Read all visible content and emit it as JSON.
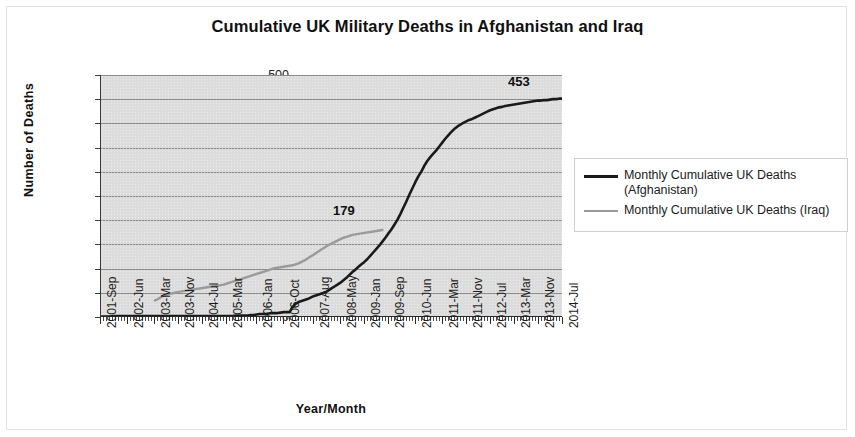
{
  "chart_data": {
    "type": "line",
    "title": "Cumulative UK Military Deaths in Afghanistan and Iraq",
    "xlabel": "Year/Month",
    "ylabel": "Number of  Deaths",
    "ylim": [
      0,
      500
    ],
    "ytick_step": 50,
    "yticks": [
      0,
      50,
      100,
      150,
      200,
      250,
      300,
      350,
      400,
      450,
      500
    ],
    "grid": "horizontal",
    "legend_position": "right",
    "plot_background": "#dcdcdc",
    "x_tick_labels": [
      "2001-Sep",
      "2002-Jun",
      "2003-Mar",
      "2003-Nov",
      "2004-Jul",
      "2005-Mar",
      "2006-Jan",
      "2006-Oct",
      "2007-Aug",
      "2008-May",
      "2009-Jan",
      "2009-Sep",
      "2010-Jun",
      "2011-Mar",
      "2011-Nov",
      "2012-Jul",
      "2013-Mar",
      "2013-Nov",
      "2014-Jul"
    ],
    "x_tick_indices": [
      0,
      9,
      18,
      26,
      34,
      42,
      52,
      61,
      71,
      80,
      88,
      96,
      105,
      114,
      122,
      130,
      138,
      146,
      154
    ],
    "x_count": 155,
    "x_start": "2001-Sep",
    "x_end": "2014-Jul",
    "series": [
      {
        "name": "Monthly Cumulative UK Deaths (Afghanistan)",
        "color": "#1a1a1a",
        "width": 2.6,
        "end_label": "453",
        "end_value": 453,
        "values": [
          0,
          0,
          0,
          0,
          1,
          1,
          1,
          1,
          1,
          1,
          1,
          1,
          1,
          1,
          1,
          1,
          1,
          1,
          1,
          1,
          1,
          1,
          1,
          1,
          1,
          1,
          1,
          1,
          1,
          1,
          1,
          1,
          1,
          1,
          1,
          1,
          1,
          1,
          1,
          1,
          1,
          1,
          1,
          1,
          1,
          2,
          2,
          2,
          2,
          2,
          3,
          3,
          4,
          5,
          5,
          5,
          6,
          7,
          7,
          7,
          8,
          9,
          9,
          9,
          20,
          26,
          30,
          32,
          34,
          36,
          39,
          42,
          44,
          46,
          48,
          50,
          54,
          58,
          62,
          66,
          70,
          75,
          80,
          86,
          92,
          97,
          103,
          108,
          113,
          119,
          126,
          133,
          140,
          147,
          155,
          163,
          172,
          180,
          190,
          200,
          212,
          225,
          238,
          252,
          265,
          278,
          290,
          300,
          312,
          322,
          330,
          337,
          344,
          352,
          360,
          368,
          375,
          382,
          388,
          393,
          397,
          401,
          404,
          407,
          409,
          412,
          415,
          418,
          421,
          424,
          427,
          429,
          431,
          433,
          434,
          436,
          437,
          438,
          439,
          440,
          441,
          442,
          443,
          444,
          445,
          446,
          447,
          447,
          448,
          448,
          449,
          450,
          450,
          451,
          451,
          452,
          452,
          453,
          453,
          453
        ]
      },
      {
        "name": "Monthly Cumulative UK Deaths (Iraq)",
        "color": "#9a9a9a",
        "width": 2.4,
        "end_label": "179",
        "end_value": 179,
        "start_index": 18,
        "values": [
          null,
          null,
          null,
          null,
          null,
          null,
          null,
          null,
          null,
          null,
          null,
          null,
          null,
          null,
          null,
          null,
          null,
          null,
          33,
          36,
          40,
          43,
          45,
          47,
          48,
          50,
          51,
          52,
          53,
          54,
          55,
          56,
          57,
          58,
          59,
          60,
          61,
          62,
          63,
          64,
          65,
          66,
          68,
          70,
          72,
          74,
          76,
          78,
          80,
          82,
          84,
          86,
          88,
          90,
          92,
          94,
          96,
          98,
          100,
          101,
          102,
          103,
          104,
          105,
          106,
          108,
          110,
          113,
          116,
          120,
          124,
          128,
          132,
          136,
          140,
          144,
          148,
          151,
          154,
          157,
          160,
          163,
          165,
          167,
          169,
          170,
          171,
          172,
          173,
          174,
          175,
          176,
          177,
          178,
          179
        ]
      }
    ]
  },
  "legend": {
    "items": [
      {
        "label": "Monthly Cumulative UK Deaths (Afghanistan)",
        "label_line1": "Monthly Cumulative UK Deaths",
        "label_line2": "(Afghanistan)",
        "color": "#1a1a1a",
        "thickness": "3px"
      },
      {
        "label": "Monthly Cumulative UK Deaths (Iraq)",
        "label_line1": "Monthly Cumulative UK Deaths (Iraq)",
        "label_line2": "",
        "color": "#9a9a9a",
        "thickness": "2px"
      }
    ]
  }
}
